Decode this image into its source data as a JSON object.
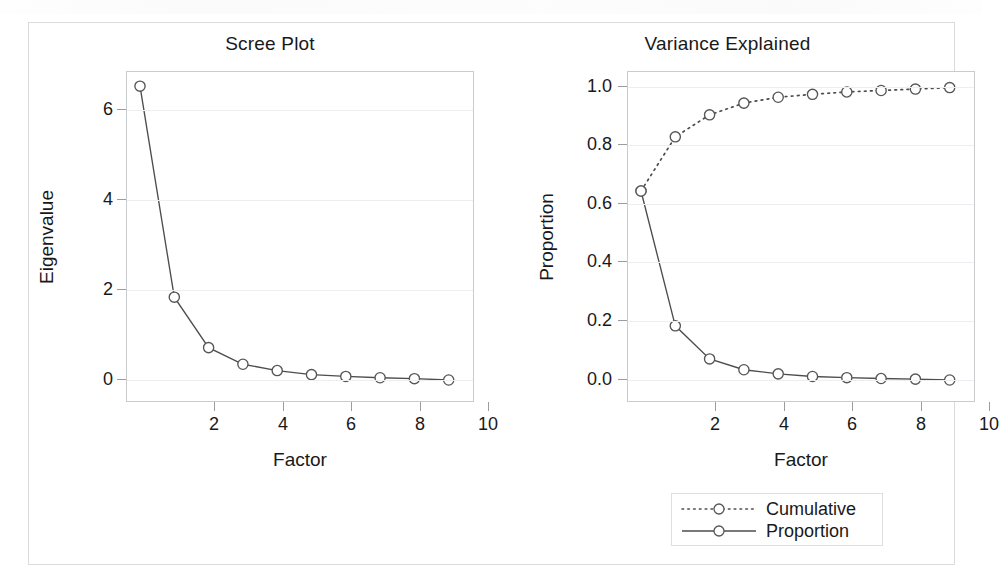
{
  "figure": {
    "panels": [
      {
        "id": "scree",
        "title": "Scree Plot",
        "xlabel": "Factor",
        "ylabel": "Eigenvalue"
      },
      {
        "id": "variance",
        "title": "Variance Explained",
        "xlabel": "Factor",
        "ylabel": "Proportion"
      }
    ]
  },
  "legend": {
    "items": [
      {
        "label": "Cumulative",
        "style": "dotted",
        "marker": "open-circle"
      },
      {
        "label": "Proportion",
        "style": "solid",
        "marker": "open-circle"
      }
    ]
  },
  "axes": {
    "scree": {
      "y_ticks": [
        "0",
        "2",
        "4",
        "6"
      ],
      "x_ticks": [
        "2",
        "4",
        "6",
        "8",
        "10"
      ]
    },
    "variance": {
      "y_ticks": [
        "0.0",
        "0.2",
        "0.4",
        "0.6",
        "0.8",
        "1.0"
      ],
      "x_ticks": [
        "2",
        "4",
        "6",
        "8",
        "10"
      ]
    }
  },
  "chart_data": [
    {
      "type": "line",
      "title": "Scree Plot",
      "xlabel": "Factor",
      "ylabel": "Eigenvalue",
      "x": [
        1,
        2,
        3,
        4,
        5,
        6,
        7,
        8,
        9,
        10
      ],
      "values": [
        6.53,
        1.84,
        0.72,
        0.35,
        0.21,
        0.12,
        0.08,
        0.05,
        0.03,
        0.0
      ],
      "marker": "open-circle",
      "linestyle": "solid",
      "xlim": [
        0.5,
        10.5
      ],
      "ylim": [
        -0.55,
        7.0
      ],
      "grid": true,
      "legend": "none",
      "color": "#4d4d4d"
    },
    {
      "type": "line",
      "title": "Variance Explained",
      "xlabel": "Factor",
      "ylabel": "Proportion",
      "x": [
        1,
        2,
        3,
        4,
        5,
        6,
        7,
        8,
        9,
        10
      ],
      "series": [
        {
          "name": "Cumulative",
          "values": [
            0.645,
            0.83,
            0.905,
            0.945,
            0.965,
            0.975,
            0.983,
            0.988,
            0.993,
            0.998
          ],
          "linestyle": "dotted",
          "marker": "open-circle",
          "color": "#4d4d4d"
        },
        {
          "name": "Proportion",
          "values": [
            0.645,
            0.185,
            0.072,
            0.035,
            0.021,
            0.012,
            0.008,
            0.005,
            0.003,
            0.0
          ],
          "linestyle": "solid",
          "marker": "open-circle",
          "color": "#4d4d4d"
        }
      ],
      "xlim": [
        0.5,
        10.5
      ],
      "ylim": [
        -0.08,
        1.06
      ],
      "grid": true,
      "legend": "bottom-right"
    }
  ],
  "colors": {
    "line": "#4d4d4d",
    "marker_stroke": "#555555",
    "marker_fill": "#ffffff",
    "grid": "#eeeef1",
    "frame": "#c9cccf",
    "outer_frame": "#d9dbdd",
    "text": "#191919"
  }
}
